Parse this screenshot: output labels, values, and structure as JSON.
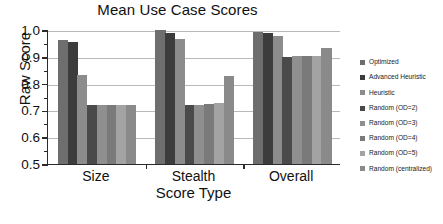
{
  "chart_data": {
    "type": "bar",
    "title": "Mean Use Case Scores",
    "xlabel": "Score Type",
    "ylabel": "Raw Score",
    "categories": [
      "Size",
      "Stealth",
      "Overall"
    ],
    "ylim": [
      0.5,
      1.0
    ],
    "ytick_labels": [
      "0.5",
      "0.6",
      "0.7",
      "0.8",
      "0.9",
      "1.0"
    ],
    "ytick_values": [
      0.5,
      0.6,
      0.7,
      0.8,
      0.9,
      1.0
    ],
    "yminor_values": [
      0.55,
      0.65,
      0.75,
      0.85,
      0.95
    ],
    "grid": "horizontal",
    "legend_position": "right",
    "series": [
      {
        "name": "Optimized",
        "color": "#6e6e6e",
        "values": [
          0.963,
          0.999,
          0.991
        ]
      },
      {
        "name": "Advanced Heuristic",
        "color": "#3c3c3c",
        "values": [
          0.954,
          0.989,
          0.99
        ]
      },
      {
        "name": "Heuristic",
        "color": "#8c8c8c",
        "values": [
          0.833,
          0.967,
          0.978
        ]
      },
      {
        "name": "Random (OD=2)",
        "color": "#4a4a4a",
        "values": [
          0.72,
          0.72,
          0.901
        ]
      },
      {
        "name": "Random (OD=3)",
        "color": "#8f8f8f",
        "values": [
          0.72,
          0.721,
          0.903
        ]
      },
      {
        "name": "Random (OD=4)",
        "color": "#7a7a7a",
        "values": [
          0.72,
          0.725,
          0.903
        ]
      },
      {
        "name": "Random (OD=5)",
        "color": "#a3a3a3",
        "values": [
          0.721,
          0.729,
          0.903
        ]
      },
      {
        "name": "Random (centralized)",
        "color": "#8a8a8a",
        "values": [
          0.721,
          0.83,
          0.934
        ]
      }
    ]
  }
}
